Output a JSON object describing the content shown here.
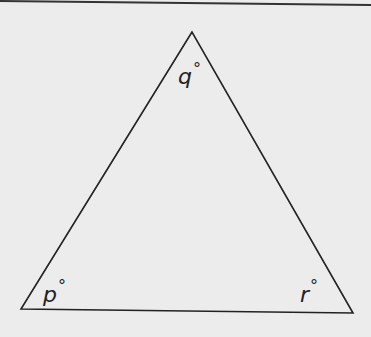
{
  "diagram": {
    "type": "triangle",
    "vertices": {
      "top": {
        "x": 192,
        "y": 32
      },
      "bottom_left": {
        "x": 21,
        "y": 309
      },
      "bottom_right": {
        "x": 353,
        "y": 313
      }
    },
    "angles": {
      "top": {
        "variable": "q",
        "unit": "°"
      },
      "bottom_left": {
        "variable": "p",
        "unit": "°"
      },
      "bottom_right": {
        "variable": "r",
        "unit": "°"
      }
    },
    "colors": {
      "background": "#ececec",
      "stroke": "#222222"
    }
  }
}
